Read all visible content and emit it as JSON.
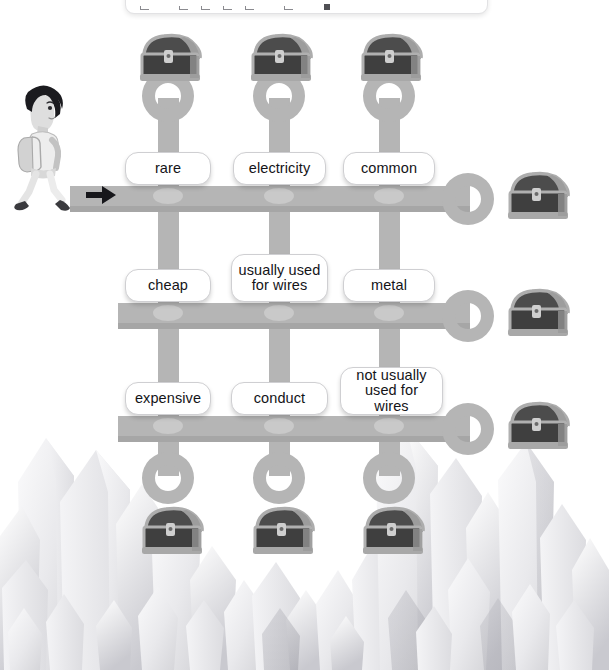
{
  "toolbar": {
    "visible": true,
    "icons": [
      "crop-icon",
      "crop-icon",
      "crop-icon",
      "crop-icon",
      "crop-icon",
      "crop-icon",
      "square-dot-icon"
    ]
  },
  "scene": {
    "character_name": "walking-student",
    "start_arrow_name": "start-arrow",
    "background_theme": "crystal-cavern"
  },
  "colors": {
    "path": "#b5b5b5",
    "path_shadow": "#a9a9a9",
    "node_highlight": "#c9c9c9",
    "pill_background": "#ffffff",
    "pill_border": "#cfcfd2",
    "text": "#141418",
    "crystal": "#e6e6e8",
    "chest_body": "#4a4a4a",
    "chest_trim": "#9a9a9a"
  },
  "grid": {
    "rows": [
      {
        "row_index": 1,
        "cells": [
          {
            "column": 1,
            "label": "rare"
          },
          {
            "column": 2,
            "label": "electricity"
          },
          {
            "column": 3,
            "label": "common"
          }
        ]
      },
      {
        "row_index": 2,
        "cells": [
          {
            "column": 1,
            "label": "cheap"
          },
          {
            "column": 2,
            "label": "usually used\nfor wires"
          },
          {
            "column": 3,
            "label": "metal"
          }
        ]
      },
      {
        "row_index": 3,
        "cells": [
          {
            "column": 1,
            "label": "expensive"
          },
          {
            "column": 2,
            "label": "conduct"
          },
          {
            "column": 3,
            "label": "not usually\nused for wires"
          }
        ]
      }
    ]
  },
  "chests": {
    "top_row": [
      "treasure-chest",
      "treasure-chest",
      "treasure-chest"
    ],
    "right_column": [
      "treasure-chest",
      "treasure-chest",
      "treasure-chest"
    ],
    "bottom_row": [
      "treasure-chest",
      "treasure-chest",
      "treasure-chest"
    ]
  },
  "rings": {
    "top": 3,
    "right": 3,
    "bottom": 3
  }
}
